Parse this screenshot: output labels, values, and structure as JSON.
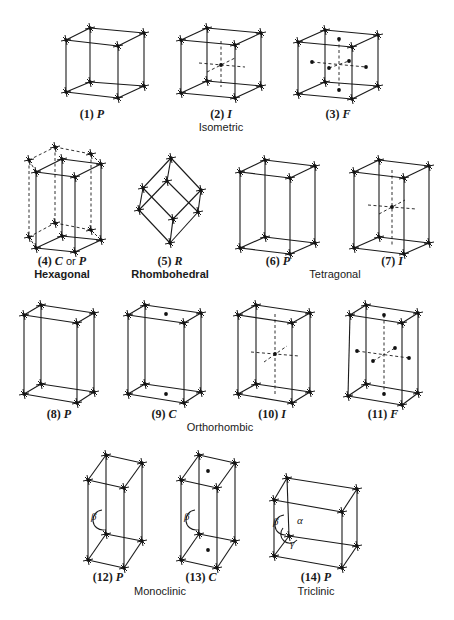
{
  "figure": {
    "lattices": [
      {
        "id": 1,
        "num": "(1)",
        "symbol": "P",
        "system": "Isometric",
        "top": [
          [
            66,
            40
          ],
          [
            90,
            28
          ],
          [
            144,
            33
          ],
          [
            118,
            46
          ]
        ],
        "bottom": [
          [
            66,
            92
          ],
          [
            90,
            82
          ],
          [
            144,
            86
          ],
          [
            118,
            98
          ]
        ],
        "dots": [],
        "dashes": [],
        "label_pos": [
          92,
          115
        ]
      },
      {
        "id": 2,
        "num": "(2)",
        "symbol": "I",
        "system": "Isometric",
        "top": [
          [
            181,
            40
          ],
          [
            207,
            28
          ],
          [
            261,
            33
          ],
          [
            235,
            45
          ]
        ],
        "bottom": [
          [
            181,
            93
          ],
          [
            207,
            81
          ],
          [
            261,
            86
          ],
          [
            235,
            98
          ]
        ],
        "dots": [
          [
            221,
            65
          ]
        ],
        "dashes": [
          [
            [
              221,
              41
            ],
            [
              221,
              87
            ]
          ],
          [
            [
              199,
              63
            ],
            [
              245,
              67
            ]
          ],
          [
            [
              207,
              72
            ],
            [
              235,
              58
            ]
          ]
        ],
        "label_pos": [
          221,
          115
        ]
      },
      {
        "id": 3,
        "num": "(3)",
        "symbol": "F",
        "system": "Isometric",
        "top": [
          [
            298,
            42
          ],
          [
            325,
            30
          ],
          [
            378,
            35
          ],
          [
            352,
            47
          ]
        ],
        "bottom": [
          [
            298,
            94
          ],
          [
            325,
            82
          ],
          [
            378,
            86
          ],
          [
            352,
            99
          ]
        ],
        "dots": [
          [
            339,
            39
          ],
          [
            339,
            90
          ],
          [
            312,
            62
          ],
          [
            366,
            67
          ],
          [
            329,
            68
          ],
          [
            349,
            61
          ]
        ],
        "dashes": [
          [
            [
              339,
              39
            ],
            [
              339,
              90
            ]
          ],
          [
            [
              312,
              62
            ],
            [
              366,
              67
            ]
          ],
          [
            [
              329,
              68
            ],
            [
              349,
              61
            ]
          ]
        ],
        "label_pos": [
          338,
          115
        ]
      },
      {
        "id": 4,
        "num": "(4)",
        "symbol": "C",
        "extra": " or ",
        "symbol2": "P",
        "system": "Hexagonal",
        "top": [
          [
            36,
            172
          ],
          [
            62,
            159
          ],
          [
            101,
            164
          ],
          [
            75,
            177
          ]
        ],
        "bottom": [
          [
            36,
            248
          ],
          [
            62,
            236
          ],
          [
            101,
            240
          ],
          [
            75,
            252
          ]
        ],
        "hex_top": [
          [
            29,
            160
          ],
          [
            55,
            147
          ],
          [
            91,
            154
          ]
        ],
        "hex_bottom": [
          [
            29,
            237
          ],
          [
            55,
            223
          ],
          [
            91,
            230
          ]
        ],
        "dots": [],
        "dashes": [],
        "label_pos": [
          62,
          262
        ]
      },
      {
        "id": 5,
        "num": "(5)",
        "symbol": "R",
        "system": "Rhombohedral",
        "rhombo": {
          "top": [
            171,
            158
          ],
          "a": [
            143,
            188
          ],
          "b": [
            167,
            181
          ],
          "c": [
            201,
            190
          ],
          "d": [
            139,
            210
          ],
          "e": [
            198,
            212
          ],
          "f": [
            173,
            219
          ],
          "bottom": [
            170,
            243
          ]
        },
        "dots": [],
        "dashes": [],
        "label_pos": [
          170,
          262
        ]
      },
      {
        "id": 6,
        "num": "(6)",
        "symbol": "P",
        "system": "Tetragonal",
        "top": [
          [
            240,
            172
          ],
          [
            265,
            160
          ],
          [
            315,
            166
          ],
          [
            290,
            178
          ]
        ],
        "bottom": [
          [
            240,
            248
          ],
          [
            265,
            237
          ],
          [
            315,
            243
          ],
          [
            290,
            254
          ]
        ],
        "dots": [],
        "dashes": [],
        "label_pos": [
          278,
          262
        ]
      },
      {
        "id": 7,
        "num": "(7)",
        "symbol": "I",
        "system": "Tetragonal",
        "top": [
          [
            354,
            172
          ],
          [
            379,
            160
          ],
          [
            429,
            166
          ],
          [
            404,
            178
          ]
        ],
        "bottom": [
          [
            354,
            248
          ],
          [
            379,
            237
          ],
          [
            429,
            243
          ],
          [
            404,
            254
          ]
        ],
        "dots": [
          [
            392,
            207
          ]
        ],
        "dashes": [
          [
            [
              392,
              170
            ],
            [
              392,
              245
            ]
          ],
          [
            [
              368,
              205
            ],
            [
              416,
              209
            ]
          ],
          [
            [
              379,
              214
            ],
            [
              405,
              200
            ]
          ]
        ],
        "label_pos": [
          392,
          262
        ]
      },
      {
        "id": 8,
        "num": "(8)",
        "symbol": "P",
        "system": "Orthorhombic",
        "top": [
          [
            24,
            315
          ],
          [
            41,
            305
          ],
          [
            94,
            313
          ],
          [
            77,
            323
          ]
        ],
        "bottom": [
          [
            24,
            394
          ],
          [
            41,
            384
          ],
          [
            94,
            392
          ],
          [
            77,
            403
          ]
        ],
        "dots": [],
        "dashes": [],
        "label_pos": [
          59,
          415
        ]
      },
      {
        "id": 9,
        "num": "(9)",
        "symbol": "C",
        "system": "Orthorhombic",
        "top": [
          [
            128,
            315
          ],
          [
            145,
            305
          ],
          [
            201,
            313
          ],
          [
            184,
            323
          ]
        ],
        "bottom": [
          [
            128,
            394
          ],
          [
            145,
            384
          ],
          [
            201,
            392
          ],
          [
            184,
            403
          ]
        ],
        "dots": [
          [
            166,
            314
          ],
          [
            166,
            394
          ]
        ],
        "dashes": [],
        "label_pos": [
          164,
          415
        ]
      },
      {
        "id": 10,
        "num": "(10)",
        "symbol": "I",
        "system": "Orthorhombic",
        "top": [
          [
            238,
            315
          ],
          [
            256,
            305
          ],
          [
            310,
            313
          ],
          [
            292,
            323
          ]
        ],
        "bottom": [
          [
            238,
            394
          ],
          [
            256,
            384
          ],
          [
            310,
            392
          ],
          [
            292,
            403
          ]
        ],
        "dots": [
          [
            275,
            354
          ]
        ],
        "dashes": [
          [
            [
              275,
              314
            ],
            [
              275,
              394
            ]
          ],
          [
            [
              251,
              352
            ],
            [
              299,
              356
            ]
          ],
          [
            [
              264,
              362
            ],
            [
              287,
              346
            ]
          ]
        ],
        "label_pos": [
          272,
          415
        ]
      },
      {
        "id": 11,
        "num": "(11)",
        "symbol": "F",
        "system": "Orthorhombic",
        "top": [
          [
            350,
            315
          ],
          [
            366,
            305
          ],
          [
            418,
            313
          ],
          [
            402,
            323
          ]
        ],
        "bottom": [
          [
            348,
            396
          ],
          [
            366,
            384
          ],
          [
            418,
            393
          ],
          [
            402,
            405
          ]
        ],
        "dots": [
          [
            384,
            315
          ],
          [
            384,
            394
          ],
          [
            357,
            351
          ],
          [
            409,
            358
          ],
          [
            373,
            361
          ],
          [
            395,
            348
          ]
        ],
        "dashes": [
          [
            [
              384,
              315
            ],
            [
              384,
              394
            ]
          ],
          [
            [
              357,
              351
            ],
            [
              409,
              358
            ]
          ],
          [
            [
              373,
              361
            ],
            [
              395,
              348
            ]
          ]
        ],
        "label_pos": [
          383,
          415
        ]
      },
      {
        "id": 12,
        "num": "(12)",
        "symbol": "P",
        "system": "Monoclinic",
        "top": [
          [
            88,
            480
          ],
          [
            106,
            455
          ],
          [
            142,
            463
          ],
          [
            124,
            488
          ]
        ],
        "bottom": [
          [
            88,
            560
          ],
          [
            106,
            534
          ],
          [
            142,
            541
          ],
          [
            124,
            568
          ]
        ],
        "dots": [],
        "dashes": [],
        "beta": [
          95,
          518
        ],
        "label_pos": [
          108,
          578
        ]
      },
      {
        "id": 13,
        "num": "(13)",
        "symbol": "C",
        "system": "Monoclinic",
        "top": [
          [
            181,
            480
          ],
          [
            199,
            455
          ],
          [
            235,
            463
          ],
          [
            217,
            488
          ]
        ],
        "bottom": [
          [
            181,
            560
          ],
          [
            199,
            534
          ],
          [
            235,
            541
          ],
          [
            217,
            568
          ]
        ],
        "dots": [
          [
            208,
            471
          ],
          [
            208,
            550
          ]
        ],
        "dashes": [],
        "beta": [
          188,
          518
        ],
        "label_pos": [
          201,
          578
        ]
      },
      {
        "id": 14,
        "num": "(14)",
        "symbol": "P",
        "system": "Triclinic",
        "top": [
          [
            274,
            500
          ],
          [
            287,
            478
          ],
          [
            357,
            489
          ],
          [
            342,
            512
          ]
        ],
        "bottom": [
          [
            274,
            556
          ],
          [
            289,
            536
          ],
          [
            357,
            546
          ],
          [
            342,
            568
          ]
        ],
        "dots": [],
        "dashes": [],
        "beta": [
          277,
          523
        ],
        "alpha": [
          301,
          522
        ],
        "gamma": [
          294,
          545
        ],
        "label_pos": [
          316,
          578
        ]
      }
    ],
    "system_labels": [
      {
        "text": "Isometric",
        "pos": [
          221,
          128
        ]
      },
      {
        "text": "Hexagonal",
        "pos": [
          62,
          275
        ]
      },
      {
        "text": "Rhombohedral",
        "pos": [
          170,
          275
        ]
      },
      {
        "text": "Tetragonal",
        "pos": [
          335,
          275
        ]
      },
      {
        "text": "Orthorhombic",
        "pos": [
          220,
          428
        ]
      },
      {
        "text": "Monoclinic",
        "pos": [
          160,
          592
        ]
      },
      {
        "text": "Triclinic",
        "pos": [
          316,
          592
        ]
      }
    ],
    "greek": {
      "beta": "β",
      "alpha": "α",
      "gamma": "γ"
    }
  }
}
